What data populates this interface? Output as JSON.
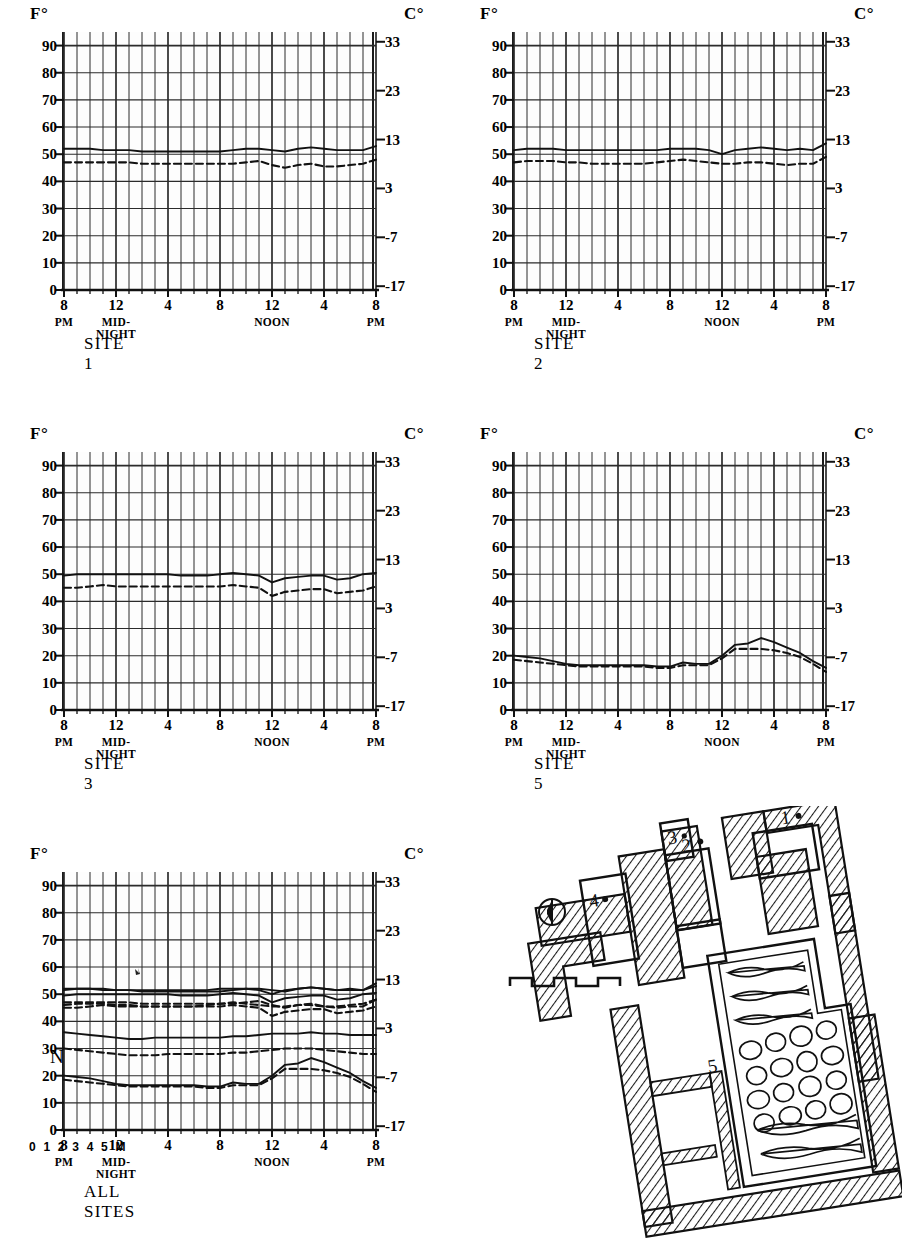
{
  "figure": {
    "axis_unit_left": "F°",
    "axis_unit_right": "C°",
    "y_ticks_f": [
      0,
      10,
      20,
      30,
      40,
      50,
      60,
      70,
      80,
      90
    ],
    "y_ticks_c": [
      -17,
      -7,
      3,
      13,
      23,
      33
    ],
    "y_range_f": [
      0,
      95
    ],
    "x_ticks": [
      {
        "label": "8",
        "sub": "PM",
        "hour": 0
      },
      {
        "label": "12",
        "sub": "MID-NIGHT",
        "hour": 4
      },
      {
        "label": "4",
        "sub": "",
        "hour": 8
      },
      {
        "label": "8",
        "sub": "",
        "hour": 12
      },
      {
        "label": "12",
        "sub": "NOON",
        "hour": 16
      },
      {
        "label": "4",
        "sub": "",
        "hour": 20
      },
      {
        "label": "8",
        "sub": "PM",
        "hour": 24
      }
    ],
    "series_legend": [
      {
        "name": "solid",
        "style": "solid",
        "description": "solid line"
      },
      {
        "name": "dashed",
        "style": "dashed",
        "description": "dashed line"
      }
    ]
  },
  "chart_data": [
    {
      "type": "line",
      "title": "SITE 1",
      "xlabel": "",
      "ylabel": "F°",
      "ylabel_right": "C°",
      "ylim": [
        0,
        95
      ],
      "grid": true,
      "legend": "none",
      "x": [
        0,
        1,
        2,
        3,
        4,
        5,
        6,
        7,
        8,
        9,
        10,
        11,
        12,
        13,
        14,
        15,
        16,
        17,
        18,
        19,
        20,
        21,
        22,
        23,
        24
      ],
      "series": [
        {
          "name": "solid",
          "style": "solid",
          "values": [
            52,
            52,
            52,
            51.5,
            51.5,
            51.5,
            51,
            51,
            51,
            51,
            51,
            51,
            51,
            51.5,
            52,
            52,
            51.5,
            51,
            52,
            52.5,
            52,
            51.5,
            51.5,
            51.5,
            53
          ]
        },
        {
          "name": "dashed",
          "style": "dashed",
          "values": [
            47,
            47,
            47,
            47,
            47,
            47,
            46.5,
            46.5,
            46.5,
            46.5,
            46.5,
            46.5,
            46.5,
            46.5,
            47,
            47.5,
            46,
            45,
            46,
            46.5,
            45.5,
            45.5,
            46,
            46.5,
            48
          ]
        }
      ]
    },
    {
      "type": "line",
      "title": "SITE 2",
      "xlabel": "",
      "ylabel": "F°",
      "ylabel_right": "C°",
      "ylim": [
        0,
        95
      ],
      "grid": true,
      "legend": "none",
      "x": [
        0,
        1,
        2,
        3,
        4,
        5,
        6,
        7,
        8,
        9,
        10,
        11,
        12,
        13,
        14,
        15,
        16,
        17,
        18,
        19,
        20,
        21,
        22,
        23,
        24
      ],
      "series": [
        {
          "name": "solid",
          "style": "solid",
          "values": [
            51.5,
            52,
            52,
            52,
            51.5,
            51.5,
            51.5,
            51.5,
            51.5,
            51.5,
            51.5,
            51.5,
            52,
            52,
            52,
            51.5,
            50,
            51.5,
            52,
            52.5,
            52,
            51.5,
            52,
            51.5,
            54
          ]
        },
        {
          "name": "dashed",
          "style": "dashed",
          "values": [
            47,
            47.5,
            47.5,
            47.5,
            47,
            47,
            46.5,
            46.5,
            46.5,
            46.5,
            46.5,
            47,
            47.5,
            48,
            47.5,
            47,
            46.5,
            46.5,
            47,
            47,
            46.5,
            46,
            46.5,
            46.5,
            49
          ]
        }
      ]
    },
    {
      "type": "line",
      "title": "SITE 3",
      "xlabel": "",
      "ylabel": "F°",
      "ylabel_right": "C°",
      "ylim": [
        0,
        95
      ],
      "grid": true,
      "legend": "none",
      "x": [
        0,
        1,
        2,
        3,
        4,
        5,
        6,
        7,
        8,
        9,
        10,
        11,
        12,
        13,
        14,
        15,
        16,
        17,
        18,
        19,
        20,
        21,
        22,
        23,
        24
      ],
      "series": [
        {
          "name": "solid",
          "style": "solid",
          "values": [
            49.5,
            50,
            50,
            50,
            50,
            50,
            50,
            50,
            50,
            49.5,
            49.5,
            49.5,
            50,
            50.5,
            50,
            49.5,
            47,
            48.5,
            49,
            49.5,
            49.5,
            48,
            48.5,
            50,
            50.5
          ]
        },
        {
          "name": "dashed",
          "style": "dashed",
          "values": [
            45,
            45,
            45.5,
            46,
            45.5,
            45.5,
            45.5,
            45.5,
            45.5,
            45.5,
            45.5,
            45.5,
            45.5,
            46,
            45.5,
            45,
            42,
            43.5,
            44,
            44.5,
            44.5,
            43,
            43.5,
            44,
            45.5
          ]
        }
      ]
    },
    {
      "type": "line",
      "title": "SITE 5",
      "xlabel": "",
      "ylabel": "F°",
      "ylabel_right": "C°",
      "ylim": [
        0,
        95
      ],
      "grid": true,
      "legend": "none",
      "x": [
        0,
        1,
        2,
        3,
        4,
        5,
        6,
        7,
        8,
        9,
        10,
        11,
        12,
        13,
        14,
        15,
        16,
        17,
        18,
        19,
        20,
        21,
        22,
        23,
        24
      ],
      "series": [
        {
          "name": "solid",
          "style": "solid",
          "values": [
            20,
            19.5,
            19,
            18,
            17,
            16.5,
            16.5,
            16.5,
            16.5,
            16.5,
            16.5,
            16,
            16,
            17.5,
            17,
            17,
            20,
            24,
            24.5,
            26.5,
            25,
            23,
            21,
            18,
            15.5
          ]
        },
        {
          "name": "dashed",
          "style": "dashed",
          "values": [
            18.5,
            18,
            17.5,
            17,
            16.5,
            16,
            16,
            16,
            16,
            16,
            16,
            15.5,
            15.5,
            16.5,
            16.5,
            16.5,
            19,
            22.5,
            22.5,
            22.5,
            22,
            21,
            19.5,
            17,
            14
          ]
        }
      ]
    },
    {
      "type": "line",
      "title": "ALL SITES",
      "xlabel": "",
      "ylabel": "F°",
      "ylabel_right": "C°",
      "ylim": [
        0,
        95
      ],
      "grid": true,
      "legend": "none",
      "note": "Composite overlay of all five site curves",
      "x": [
        0,
        1,
        2,
        3,
        4,
        5,
        6,
        7,
        8,
        9,
        10,
        11,
        12,
        13,
        14,
        15,
        16,
        17,
        18,
        19,
        20,
        21,
        22,
        23,
        24
      ],
      "series": [
        {
          "name": "site1-solid",
          "style": "solid",
          "values": [
            52,
            52,
            52,
            51.5,
            51.5,
            51.5,
            51,
            51,
            51,
            51,
            51,
            51,
            51,
            51.5,
            52,
            52,
            51.5,
            51,
            52,
            52.5,
            52,
            51.5,
            51.5,
            51.5,
            53
          ]
        },
        {
          "name": "site1-dashed",
          "style": "dashed",
          "values": [
            47,
            47,
            47,
            47,
            47,
            47,
            46.5,
            46.5,
            46.5,
            46.5,
            46.5,
            46.5,
            46.5,
            46.5,
            47,
            47.5,
            46,
            45,
            46,
            46.5,
            45.5,
            45.5,
            46,
            46.5,
            48
          ]
        },
        {
          "name": "site2-solid",
          "style": "solid",
          "values": [
            51.5,
            52,
            52,
            52,
            51.5,
            51.5,
            51.5,
            51.5,
            51.5,
            51.5,
            51.5,
            51.5,
            52,
            52,
            52,
            51.5,
            50,
            51.5,
            52,
            52.5,
            52,
            51.5,
            52,
            51.5,
            54
          ]
        },
        {
          "name": "site2-dashed",
          "style": "dashed",
          "values": [
            46,
            46.5,
            46.5,
            46.5,
            46,
            46,
            45.5,
            45.5,
            45.5,
            45.5,
            45.5,
            46,
            46.5,
            47,
            46.5,
            46,
            45.5,
            45.5,
            46,
            46,
            45.5,
            45,
            45.5,
            45.5,
            48
          ]
        },
        {
          "name": "site3-solid",
          "style": "solid",
          "values": [
            49.5,
            50,
            50,
            50,
            50,
            50,
            50,
            50,
            50,
            49.5,
            49.5,
            49.5,
            50,
            50.5,
            50,
            49.5,
            47,
            48.5,
            49,
            49.5,
            49.5,
            48,
            48.5,
            50,
            50.5
          ]
        },
        {
          "name": "site3-dashed",
          "style": "dashed",
          "values": [
            45,
            45,
            45.5,
            46,
            45.5,
            45.5,
            45.5,
            45.5,
            45.5,
            45.5,
            45.5,
            45.5,
            45.5,
            46,
            45.5,
            45,
            42,
            43.5,
            44,
            44.5,
            44.5,
            43,
            43.5,
            44,
            45.5
          ]
        },
        {
          "name": "site4-solid",
          "style": "solid",
          "values": [
            36,
            35.5,
            35,
            34.5,
            34,
            33.5,
            33.5,
            34,
            34,
            34,
            34,
            34,
            34,
            34.5,
            34.5,
            35,
            35.5,
            35.5,
            35.5,
            36,
            35.5,
            35.5,
            35,
            35,
            35
          ]
        },
        {
          "name": "site4-dashed",
          "style": "dashed",
          "values": [
            30,
            29.5,
            29,
            28.5,
            28,
            27.5,
            27.5,
            27.5,
            28,
            28,
            28,
            28,
            28,
            28.5,
            28.5,
            29,
            29.5,
            30,
            30,
            30,
            29.5,
            29,
            28.5,
            28,
            28
          ]
        },
        {
          "name": "site5-solid",
          "style": "solid",
          "values": [
            20,
            19.5,
            19,
            18,
            17,
            16.5,
            16.5,
            16.5,
            16.5,
            16.5,
            16.5,
            16,
            16,
            17.5,
            17,
            17,
            20,
            24,
            24.5,
            26.5,
            25,
            23,
            21,
            18,
            15.5
          ]
        },
        {
          "name": "site5-dashed",
          "style": "dashed",
          "values": [
            18.5,
            18,
            17.5,
            17,
            16.5,
            16,
            16,
            16,
            16,
            16,
            16,
            15.5,
            15.5,
            16.5,
            16.5,
            16.5,
            19,
            22.5,
            22.5,
            22.5,
            22,
            21,
            19.5,
            17,
            14
          ]
        }
      ]
    }
  ],
  "siteplan": {
    "name": "archaeological-site-plan",
    "north_label": "N",
    "scale_label": "0 1 2 3 4 5 M",
    "room_labels": [
      {
        "id": "1",
        "label": "1"
      },
      {
        "id": "2",
        "label": "2"
      },
      {
        "id": "3",
        "label": "3"
      },
      {
        "id": "4",
        "label": "4"
      },
      {
        "id": "5",
        "label": "5"
      }
    ]
  }
}
